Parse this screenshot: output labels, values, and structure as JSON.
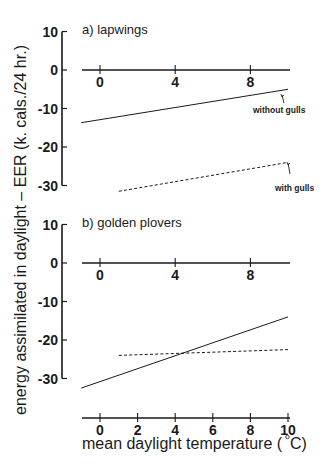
{
  "chart_data": {
    "type": "line",
    "ylabel": "energy assimilated in daylight – EER (k. cals./24 hr.)",
    "xlabel": "mean daylight temperature (°C)",
    "x_ticks": [
      0,
      2,
      4,
      6,
      8,
      10
    ],
    "xlim": [
      -1,
      10
    ],
    "grid": false,
    "panels": [
      {
        "title": "a) lapwings",
        "ylim": [
          -30,
          10
        ],
        "y_ticks": [
          10,
          0,
          -10,
          -20,
          -30
        ],
        "zero_axis_ticks": [
          0,
          4,
          8
        ],
        "series": [
          {
            "name": "without gulls",
            "style": "solid",
            "x": [
              -1,
              10
            ],
            "y": [
              -13.7,
              -5
            ]
          },
          {
            "name": "with gulls",
            "style": "dashed",
            "x": [
              1,
              10
            ],
            "y": [
              -31.5,
              -24
            ]
          }
        ],
        "annotations": [
          "without gulls",
          "with gulls"
        ]
      },
      {
        "title": "b) golden plovers",
        "ylim": [
          -30,
          10
        ],
        "y_ticks": [
          10,
          0,
          -10,
          -20,
          -30
        ],
        "zero_axis_ticks": [
          0,
          4,
          8
        ],
        "series": [
          {
            "name": "without gulls",
            "style": "solid",
            "x": [
              -1,
              10
            ],
            "y": [
              -32.5,
              -14
            ]
          },
          {
            "name": "with gulls",
            "style": "dashed",
            "x": [
              1,
              10
            ],
            "y": [
              -24,
              -22.5
            ]
          }
        ]
      }
    ]
  },
  "labels": {
    "ylabel": "energy assimilated in daylight – EER (k. cals./24 hr.)",
    "xlabel_main": "mean daylight temperature (",
    "xlabel_unit": "C)",
    "panel_a": "a) lapwings",
    "panel_b": "b) golden plovers",
    "annot_without": "without gulls",
    "annot_with": "with gulls"
  }
}
